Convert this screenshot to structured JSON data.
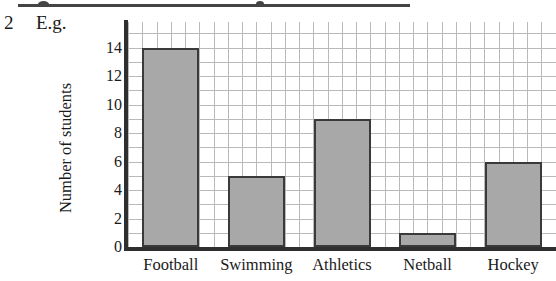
{
  "question": {
    "number": "2",
    "label": "E.g."
  },
  "chart_data": {
    "type": "bar",
    "title": "",
    "xlabel": "",
    "ylabel": "Number of students",
    "categories": [
      "Football",
      "Swimming",
      "Athletics",
      "Netball",
      "Hockey"
    ],
    "values": [
      14,
      5,
      9,
      1,
      6
    ],
    "ylim": [
      0,
      16
    ],
    "ytick_labels": [
      "0",
      "2",
      "4",
      "6",
      "8",
      "10",
      "12",
      "14"
    ],
    "ytick_values": [
      0,
      2,
      4,
      6,
      8,
      10,
      12,
      14
    ],
    "grid": true,
    "grid_minor": true,
    "legend": "none",
    "colors": {
      "bar_fill": "#a8a8a8",
      "bar_edge": "#3a3a3a",
      "axis": "#2f2f2f",
      "gridline": "#b9b9b9",
      "background": "#ffffff",
      "text": "#1a1a1a"
    }
  }
}
